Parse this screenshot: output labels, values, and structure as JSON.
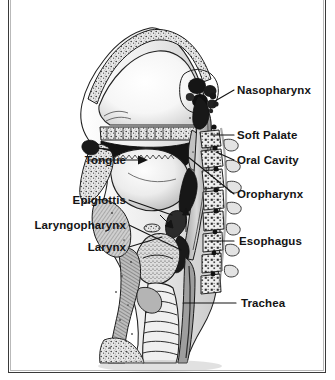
{
  "figure": {
    "kind": "anatomical-illustration",
    "style": "black-and-white engraving / halftone",
    "background_color": "#ffffff",
    "ink_color": "#141414",
    "frame_color": "#3a3a3a"
  },
  "labels": {
    "nasopharynx": "Nasopharynx",
    "soft_palate": "Soft Palate",
    "oral_cavity": "Oral Cavity",
    "oropharynx": "Oropharynx",
    "esophagus": "Esophagus",
    "trachea": "Trachea",
    "tongue": "Tongue",
    "epiglottis": "Epiglottis",
    "laryngopharynx": "Laryngopharynx",
    "larynx": "Larynx"
  }
}
